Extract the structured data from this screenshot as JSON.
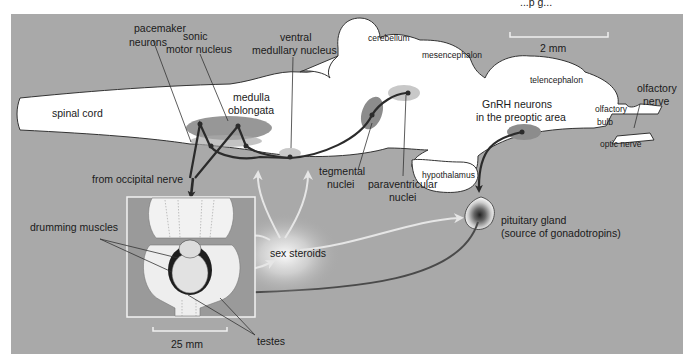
{
  "header": {
    "partial_text": "...p g..."
  },
  "colors": {
    "background_panel": "#a9a9a9",
    "brain_fill": "#ffffff",
    "nucleus_dark": "#8c8c8c",
    "nucleus_light": "#c8c8c8",
    "pathway_dark": "#2b2b2b",
    "pathway_steroid": "#e6e6e6",
    "hypophyseal_path": "#4a4a4a"
  },
  "scale_bars": {
    "brain": "2 mm",
    "body": "25 mm"
  },
  "brain_regions": {
    "spinal_cord": "spinal cord",
    "medulla_line1": "medulla",
    "medulla_line2": "oblongata",
    "cerebellum": "cerebellum",
    "mesencephalon": "mesencephalon",
    "telencephalon": "telencephalon",
    "olfactory_bulb_line1": "olfactory",
    "olfactory_bulb_line2": "bulb",
    "optic_nerve": "optic nerve",
    "hypothalamus": "hypothalamus"
  },
  "labels": {
    "pacemaker_line1": "pacemaker",
    "pacemaker_line2": "neurons",
    "sonic_line1": "sonic",
    "sonic_line2": "motor nucleus",
    "ventral_line1": "ventral",
    "ventral_line2": "medullary nucleus",
    "olfactory_nerve_line1": "olfactory",
    "olfactory_nerve_line2": "nerve",
    "gnrh_line1": "GnRH neurons",
    "gnrh_line2": "in the preoptic area",
    "tegmental_line1": "tegmental",
    "tegmental_line2": "nuclei",
    "paraventricular_line1": "paraventricular",
    "paraventricular_line2": "nuclei",
    "occipital_nerve": "from occipital nerve",
    "drumming_muscles": "drumming muscles",
    "sex_steroids": "sex steroids",
    "pituitary_line1": "pituitary gland",
    "pituitary_line2": "(source of gonadotropins)",
    "testes": "testes"
  }
}
